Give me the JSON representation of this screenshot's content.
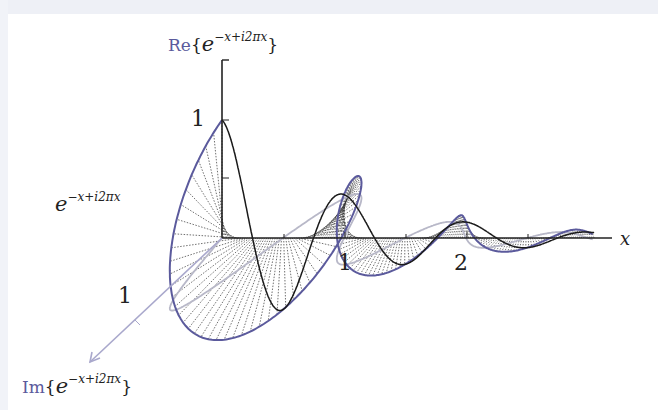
{
  "diagram": {
    "axes": {
      "real": {
        "label_prefix": "Re",
        "label_expr": "e",
        "label_sup": "−x+i2πx",
        "tick_label": "1"
      },
      "imag": {
        "label_prefix": "Im",
        "label_expr": "e",
        "label_sup": "−x+i2πx",
        "tick_label": "1"
      },
      "x": {
        "label": "x",
        "tick_labels": [
          "1",
          "2"
        ]
      }
    },
    "curve_label": {
      "base": "e",
      "sup": "−x+i2πx"
    },
    "colors": {
      "helix": "#5b5a9c",
      "real_projection": "#1a1a1a",
      "imag_projection": "#b8b8c8",
      "hatching": "#333333",
      "axis": "#222222",
      "imag_axis": "#a9a8cc"
    }
  }
}
